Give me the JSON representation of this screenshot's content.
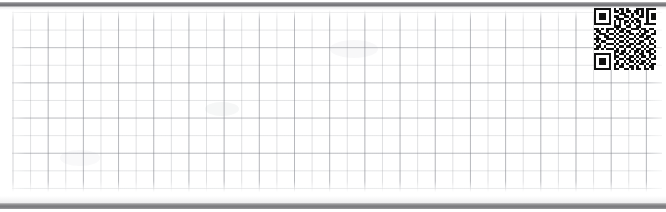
{
  "document": {
    "kind": "scanned-graph-paper-strip",
    "sheet_state": "blank",
    "visible_text": "",
    "grid": {
      "minor_cell_px": 17.6,
      "major_every_cells": 2,
      "minor_line_color": "#96989e",
      "major_line_color": "#80828a",
      "paper_color": "#ffffff"
    },
    "scan_bars": {
      "top_color": "#7d7d80",
      "bottom_color": "#8a8a8c"
    },
    "qr": {
      "name": "qr-code",
      "label": "",
      "x": 594,
      "y": 8,
      "size": 62,
      "modules": 25,
      "dark_color": "#101010",
      "light_color": "#ffffff",
      "matrix": [
        "1111111010110100011101111111",
        "1000001011010110110101000001",
        "1011101000111001010101011101",
        "1011101011001101001101011101",
        "1011101001110010110001011101",
        "1000001010101101011001000001",
        "1111111010101010101011111111",
        "0000000011100110011000000000",
        "1101011101011001110110110101",
        "0110010010110110001011001100",
        "1011101101001011010110011010",
        "0100110010110100101101100101",
        "1110011101001011010011010110",
        "0101100010110100101100101011",
        "1010011101001011011010110100",
        "0110100010110110100101001101",
        "1101011101001001011010110010",
        "0000000011011010110101101011",
        "1111111010110100101100110101",
        "1000001011001011010110101010",
        "1011101010110110101001011011",
        "1011101001001011010110100110",
        "1011101011010100101101011010",
        "1000001010110011010010110101",
        "1111111011001101011011010011"
      ]
    }
  }
}
